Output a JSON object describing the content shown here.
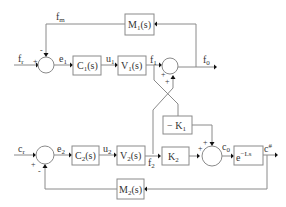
{
  "diagram": {
    "type": "block-diagram",
    "loop1": {
      "input": {
        "base": "f",
        "sub": "r"
      },
      "error": {
        "base": "e",
        "sub": "1"
      },
      "controller": {
        "base": "C",
        "sub": "1",
        "arg": "(s)"
      },
      "control": {
        "base": "u",
        "sub": "1"
      },
      "plant": {
        "base": "V",
        "sub": "1",
        "arg": "(s)"
      },
      "plant_out": {
        "base": "f",
        "sub": "1"
      },
      "output": {
        "base": "f",
        "sub": "0"
      },
      "feedback_block": {
        "base": "M",
        "sub": "1",
        "arg": "(s)"
      },
      "feedback_signal": {
        "base": "f",
        "sub": "m"
      },
      "sum_signs": {
        "plus": "+",
        "minus": "-"
      }
    },
    "loop2": {
      "input": {
        "base": "c",
        "sub": "r"
      },
      "error": {
        "base": "e",
        "sub": "2"
      },
      "controller": {
        "base": "C",
        "sub": "2",
        "arg": "(s)"
      },
      "control": {
        "base": "u",
        "sub": "2"
      },
      "plant": {
        "base": "V",
        "sub": "2",
        "arg": "(s)"
      },
      "plant_out": {
        "base": "f",
        "sub": "2"
      },
      "gain_block": {
        "base": "K",
        "sub": "2"
      },
      "cross_gain": {
        "prefix": "− K",
        "sub": "1"
      },
      "sum_out": {
        "base": "c",
        "sub": "0"
      },
      "delay_block": {
        "base": "e",
        "sup": "−Ls"
      },
      "output": {
        "base": "c",
        "sup": "#"
      },
      "feedback_block": {
        "base": "M",
        "sub": "2",
        "arg": "(s)"
      },
      "sum_signs": {
        "plus": "+",
        "minus": "-"
      }
    },
    "coupling_sum_signs": {
      "plus1": "+",
      "plus2": "+"
    },
    "loop2_out_sum_signs": {
      "plus1": "+",
      "plus2": "+"
    }
  }
}
